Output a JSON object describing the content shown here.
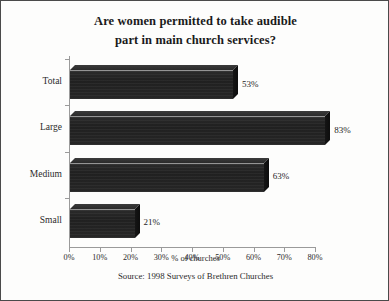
{
  "chart_data": {
    "type": "bar",
    "orientation": "horizontal",
    "title": "Are women permitted to take audible part in main church services?",
    "title_lines": [
      "Are women permitted to take audible",
      "part in main church services?"
    ],
    "categories": [
      "Total",
      "Large",
      "Medium",
      "Small"
    ],
    "values": [
      53,
      83,
      63,
      21
    ],
    "value_labels": [
      "53%",
      "83%",
      "63%",
      "21%"
    ],
    "xlabel": "% of churches",
    "ylabel": "",
    "xlim": [
      0,
      80
    ],
    "xticks": [
      0,
      10,
      20,
      30,
      40,
      50,
      60,
      70,
      80
    ],
    "xtick_labels": [
      "0%",
      "10%",
      "20%",
      "30%",
      "40%",
      "50%",
      "60%",
      "70%",
      "80%"
    ],
    "grid": false,
    "legend": false,
    "style_3d": true,
    "bar_color": "#242424",
    "axis_color": "#9a9a9a",
    "source": "Source: 1998 Surveys of Brethren Churches"
  },
  "figure": {
    "border_color": "#4a4a4a",
    "background": "#fdfdfc"
  }
}
